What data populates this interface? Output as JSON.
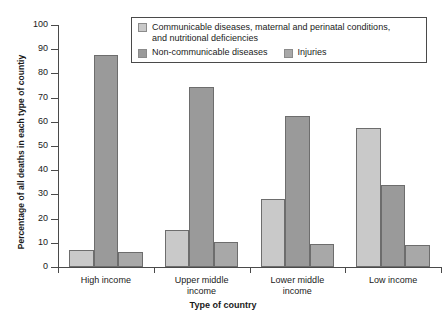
{
  "top_trace": "",
  "chart_data": {
    "type": "bar",
    "title": "",
    "xlabel": "Type of country",
    "ylabel": "Percentage of all deaths in each type of countiy",
    "ylim": [
      0,
      100
    ],
    "ytick_labels": [
      "0",
      "10",
      "20",
      "30",
      "40",
      "50",
      "60",
      "70",
      "80",
      "90",
      "100"
    ],
    "ytick_values": [
      0,
      10,
      20,
      30,
      40,
      50,
      60,
      70,
      80,
      90,
      100
    ],
    "grid": false,
    "legend_position": "top-center",
    "categories": [
      "High income",
      "Upper middle income",
      "Lower middle income",
      "Low income"
    ],
    "series": [
      {
        "name": "Communicable diseases, maternal and perinatal conditions, and nutritional deficiencies",
        "color": "#c9c9c9",
        "values": [
          7,
          15.5,
          28,
          57.5
        ]
      },
      {
        "name": "Non-communicable diseases",
        "color": "#9a9a9a",
        "values": [
          87.5,
          74.5,
          62.5,
          34
        ]
      },
      {
        "name": "Injuries",
        "color": "#a8a8a8",
        "values": [
          6,
          10.5,
          9.5,
          9
        ]
      }
    ]
  },
  "legend": {
    "items": [
      {
        "label": "Communicable diseases, maternal and perinatal conditions,",
        "label2": "and nutritional deficiencies",
        "color": "#c9c9c9"
      },
      {
        "label": "Non-communicable diseases",
        "color": "#9a9a9a"
      },
      {
        "label": "Injuries",
        "color": "#a8a8a8"
      }
    ]
  }
}
